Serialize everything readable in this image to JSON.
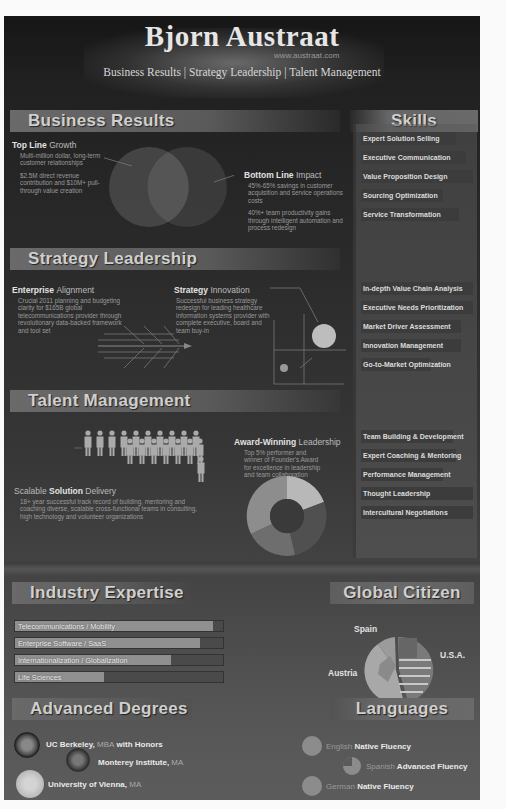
{
  "header": {
    "title": "Bjorn Austraat",
    "url": "www.austraat.com",
    "subtitle": "Business Results | Strategy Leadership | Talent Management"
  },
  "business_results": {
    "heading": "Business Results",
    "top_line": {
      "label_bold": "Top Line",
      "label_light": "Growth",
      "para1": "Multi-million dollar, long-term customer relationships",
      "para2": "$2.5M direct revenue contribution and $10M+ pull-through value creation"
    },
    "bottom_line": {
      "label_bold": "Bottom Line",
      "label_light": "Impact",
      "para1": "45%-65% savings in customer acquisition and service operations costs",
      "para2": "40%+ team productivity gains through intelligent automation and process redesign"
    }
  },
  "strategy_leadership": {
    "heading": "Strategy Leadership",
    "enterprise": {
      "label_bold": "Enterprise",
      "label_light": "Alignment",
      "text": "Crucial 2011 planning and budgeting clarity for $165B global telecommunications provider through revolutionary data-backed framework and tool set"
    },
    "innovation": {
      "label_bold": "Strategy",
      "label_light": "Innovation",
      "text": "Successful business strategy redesign for leading healthcare information systems provider with complete executive, board and team buy-in"
    }
  },
  "talent_management": {
    "heading": "Talent Management",
    "delivery": {
      "label_light1": "Scalable",
      "label_bold": "Solution",
      "label_light2": "Delivery",
      "text": "18+ year successful track record of building, mentoring and coaching diverse, scalable cross-functional teams in consulting, high technology and volunteer organizations"
    },
    "award": {
      "label_bold": "Award-Winning",
      "label_light": "Leadership",
      "text": "Top 5% performer and winner of Founder's Award for excellence in leadership and team collaboration"
    }
  },
  "skills": {
    "heading": "Skills",
    "groups": [
      [
        {
          "label": "Expert Solution Selling",
          "width": 95
        },
        {
          "label": "Executive Communication",
          "width": 105
        },
        {
          "label": "Value Proposition Design",
          "width": 112
        },
        {
          "label": "Sourcing Optimization",
          "width": 82
        },
        {
          "label": "Service Transformation",
          "width": 98
        }
      ],
      [
        {
          "label": "In-depth Value Chain Analysis",
          "width": 112
        },
        {
          "label": "Executive Needs Prioritization",
          "width": 112
        },
        {
          "label": "Market Driver Assessment",
          "width": 100
        },
        {
          "label": "Innovation Management",
          "width": 100
        },
        {
          "label": "Go-to-Market Optimization",
          "width": 70
        }
      ],
      [
        {
          "label": "Team Building & Development",
          "width": 92
        },
        {
          "label": "Expert Coaching & Mentoring",
          "width": 95
        },
        {
          "label": "Performance Management",
          "width": 82
        },
        {
          "label": "Thought Leadership",
          "width": 112
        },
        {
          "label": "Intercultural Negotiations",
          "width": 112
        }
      ]
    ]
  },
  "industry_expertise": {
    "heading": "Industry Expertise",
    "items": [
      {
        "label": "Telecommunications / Mobility",
        "percent": 95
      },
      {
        "label": "Enterprise Software / SaaS",
        "percent": 89
      },
      {
        "label": "Internationalization / Globalization",
        "percent": 75
      },
      {
        "label": "Life Sciences",
        "percent": 43
      }
    ]
  },
  "global_citizen": {
    "heading": "Global Citizen",
    "countries": [
      {
        "label": "Spain",
        "share": 12
      },
      {
        "label": "U.S.A.",
        "share": 45
      },
      {
        "label": "Austria",
        "share": 43
      }
    ]
  },
  "advanced_degrees": {
    "heading": "Advanced Degrees",
    "items": [
      {
        "school": "UC Berkeley,",
        "degree": "MBA",
        "extra": "with Honors"
      },
      {
        "school": "Monterey Institute,",
        "degree": "MA",
        "extra": ""
      },
      {
        "school": "University of Vienna,",
        "degree": "MA",
        "extra": ""
      }
    ]
  },
  "languages": {
    "heading": "Languages",
    "items": [
      {
        "name": "English",
        "level": "Native Fluency"
      },
      {
        "name": "Spanish",
        "level": "Advanced Fluency"
      },
      {
        "name": "German",
        "level": "Native Fluency"
      }
    ]
  }
}
